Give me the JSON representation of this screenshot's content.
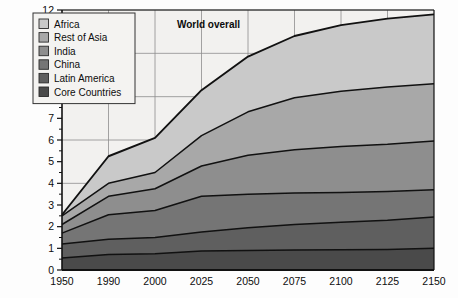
{
  "chart_data": {
    "type": "area",
    "stacked": true,
    "title": "",
    "xlabel": "",
    "ylabel": "",
    "annotations": [
      {
        "text": "World overall",
        "x_index": 3.15,
        "y_value": 11.15
      }
    ],
    "categories": [
      "1950",
      "1990",
      "2000",
      "2025",
      "2050",
      "2075",
      "2100",
      "2125",
      "2150"
    ],
    "x_axis_type": "categorical",
    "ylim": [
      0,
      12
    ],
    "ytick_values": [
      0,
      1,
      2,
      3,
      4,
      5,
      6,
      7,
      8,
      9,
      10,
      11,
      12
    ],
    "ytick_labels": [
      "0",
      "1",
      "2",
      "3",
      "4",
      "5",
      "6",
      "7",
      "8",
      "9",
      "10",
      "11",
      "12"
    ],
    "y_minor_ticks": true,
    "grid": true,
    "grid_x_categories": [
      "1990",
      "2000",
      "2025",
      "2050",
      "2075",
      "2100",
      "2125"
    ],
    "grid_y_values": [
      2,
      4,
      6,
      8,
      10,
      12
    ],
    "legend_position": "top-left",
    "series": [
      {
        "name": "Core Countries",
        "color": "#4a4a4a",
        "values": [
          0.55,
          0.72,
          0.75,
          0.88,
          0.9,
          0.92,
          0.93,
          0.95,
          1.0
        ]
      },
      {
        "name": "Latin America",
        "color": "#5f5f5f",
        "values": [
          1.2,
          1.42,
          1.5,
          1.75,
          1.95,
          2.1,
          2.2,
          2.3,
          2.45
        ]
      },
      {
        "name": "China",
        "color": "#757575",
        "values": [
          1.7,
          2.55,
          2.75,
          3.4,
          3.5,
          3.55,
          3.58,
          3.62,
          3.7
        ]
      },
      {
        "name": "India",
        "color": "#8e8e8e",
        "values": [
          2.1,
          3.4,
          3.75,
          4.8,
          5.3,
          5.55,
          5.7,
          5.8,
          5.95
        ]
      },
      {
        "name": "Rest of Asia",
        "color": "#a8a8a8",
        "values": [
          2.5,
          4.0,
          4.5,
          6.2,
          7.3,
          7.95,
          8.25,
          8.45,
          8.6
        ]
      },
      {
        "name": "Africa",
        "color": "#c9c9c9",
        "values": [
          2.55,
          5.25,
          6.1,
          8.3,
          9.85,
          10.8,
          11.3,
          11.6,
          11.8
        ]
      }
    ],
    "legend_entries": [
      {
        "label": "Africa",
        "color": "#c9c9c9"
      },
      {
        "label": "Rest of Asia",
        "color": "#a8a8a8"
      },
      {
        "label": "India",
        "color": "#8e8e8e"
      },
      {
        "label": "China",
        "color": "#757575"
      },
      {
        "label": "Latin America",
        "color": "#5f5f5f"
      },
      {
        "label": "Core Countries",
        "color": "#4a4a4a"
      }
    ],
    "style": {
      "plot_background": "#f2f1ef",
      "page_background": "#fdfdfd",
      "axis_color": "#111111",
      "grid_color": "#8d8d8d",
      "band_edge_color": "#111111",
      "legend_background": "#f4f3f1",
      "legend_border": "#333333"
    }
  }
}
